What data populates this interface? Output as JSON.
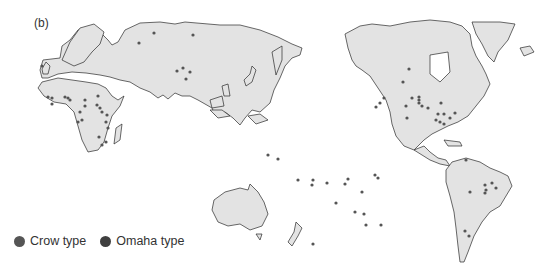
{
  "figure": {
    "panel_label": "(b)"
  },
  "legend": {
    "items": [
      {
        "label": "Crow type",
        "color": "#555555"
      },
      {
        "label": "Omaha type",
        "color": "#3f3f3f"
      }
    ]
  },
  "map": {
    "land_color": "#e3e3e3",
    "outline_color": "#2a2a2a",
    "dot_color": "#555555",
    "dots": [
      [
        154,
        33
      ],
      [
        193,
        35
      ],
      [
        139,
        43
      ],
      [
        177,
        71
      ],
      [
        190,
        72
      ],
      [
        186,
        79
      ],
      [
        183,
        68
      ],
      [
        42,
        66
      ],
      [
        48,
        97
      ],
      [
        52,
        98
      ],
      [
        65,
        97
      ],
      [
        68,
        98
      ],
      [
        70,
        100
      ],
      [
        85,
        100
      ],
      [
        52,
        104
      ],
      [
        98,
        96
      ],
      [
        85,
        106
      ],
      [
        97,
        105
      ],
      [
        100,
        108
      ],
      [
        102,
        112
      ],
      [
        107,
        115
      ],
      [
        80,
        112
      ],
      [
        82,
        120
      ],
      [
        78,
        122
      ],
      [
        106,
        122
      ],
      [
        108,
        128
      ],
      [
        99,
        137
      ],
      [
        102,
        145
      ],
      [
        106,
        142
      ],
      [
        268,
        155
      ],
      [
        278,
        159
      ],
      [
        298,
        180
      ],
      [
        313,
        180
      ],
      [
        312,
        185
      ],
      [
        327,
        183
      ],
      [
        345,
        184
      ],
      [
        348,
        179
      ],
      [
        336,
        203
      ],
      [
        355,
        212
      ],
      [
        364,
        214
      ],
      [
        375,
        175
      ],
      [
        378,
        178
      ],
      [
        362,
        192
      ],
      [
        366,
        225
      ],
      [
        381,
        225
      ],
      [
        313,
        244
      ],
      [
        384,
        98
      ],
      [
        380,
        103
      ],
      [
        376,
        107
      ],
      [
        412,
        98
      ],
      [
        419,
        97
      ],
      [
        419,
        100
      ],
      [
        419,
        103
      ],
      [
        422,
        106
      ],
      [
        428,
        108
      ],
      [
        438,
        114
      ],
      [
        441,
        103
      ],
      [
        444,
        114
      ],
      [
        440,
        122
      ],
      [
        436,
        120
      ],
      [
        444,
        124
      ],
      [
        450,
        118
      ],
      [
        455,
        113
      ],
      [
        406,
        106
      ],
      [
        407,
        118
      ],
      [
        409,
        69
      ],
      [
        403,
        82
      ],
      [
        466,
        160
      ],
      [
        485,
        185
      ],
      [
        492,
        183
      ],
      [
        485,
        193
      ],
      [
        470,
        192
      ],
      [
        486,
        190
      ],
      [
        496,
        188
      ],
      [
        465,
        231
      ],
      [
        469,
        236
      ]
    ]
  }
}
